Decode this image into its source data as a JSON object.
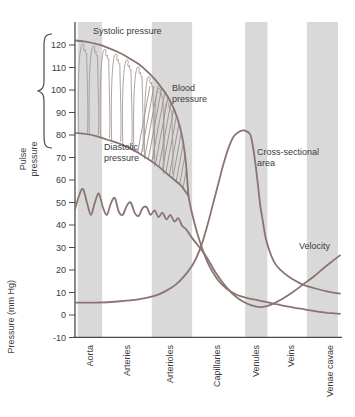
{
  "colors": {
    "curve": "#8a7471",
    "waveform": "#a39a96",
    "hatch": "#8f8782",
    "band": "#d9d9d9",
    "axis": "#4a4a4a",
    "text": "#3b3b3b"
  },
  "annotations": {
    "systolic": "Systolic pressure",
    "diastolic": "Diastolic pressure",
    "blood_pressure": "Blood pressure",
    "cross_sectional_area": "Cross-sectional area",
    "velocity": "Velocity",
    "pulse_pressure": "Pulse pressure"
  },
  "chart_data": {
    "type": "line",
    "title": "",
    "ylabel": "Pressure (mm Hg)",
    "ylim": [
      -10,
      130
    ],
    "yticks": [
      120,
      110,
      100,
      90,
      80,
      70,
      60,
      50,
      40,
      30,
      20,
      10,
      0,
      -10
    ],
    "categories": [
      "Aorta",
      "Arteries",
      "Arterioles",
      "Capillaries",
      "Venules",
      "Veins",
      "Venae cavae"
    ],
    "shaded_categories": [
      "Aorta",
      "Arterioles",
      "Venules",
      "Venae cavae"
    ],
    "grid": false,
    "legend_position": "inline-annotations",
    "annotations": [
      "Systolic pressure",
      "Diastolic pressure",
      "Blood pressure",
      "Cross-sectional area",
      "Velocity",
      "Pulse pressure"
    ],
    "x_axis_note": "x values are percent of distance along the vascular tree from aorta to venae cavae",
    "category_x_pct": [
      5.7,
      19.6,
      35.8,
      53.6,
      68.3,
      81.5,
      96.2
    ],
    "band_x_pct": [
      [
        1,
        10.2
      ],
      [
        29,
        44.2
      ],
      [
        64.2,
        72.6
      ],
      [
        87.5,
        99.2
      ]
    ],
    "series": [
      {
        "name": "Systolic pressure",
        "unit": "mm Hg",
        "points": [
          [
            0,
            122
          ],
          [
            4,
            121.5
          ],
          [
            8,
            120.5
          ],
          [
            12,
            119
          ],
          [
            16,
            117
          ],
          [
            20,
            114.5
          ],
          [
            24,
            111.5
          ],
          [
            27,
            108.5
          ],
          [
            30,
            105
          ],
          [
            33,
            100.5
          ],
          [
            36,
            95
          ],
          [
            38.5,
            88
          ],
          [
            40.5,
            79
          ],
          [
            41.8,
            68
          ],
          [
            42.8,
            53
          ]
        ]
      },
      {
        "name": "Diastolic pressure",
        "unit": "mm Hg",
        "points": [
          [
            0,
            81
          ],
          [
            4,
            80.5
          ],
          [
            8,
            79.5
          ],
          [
            12,
            78
          ],
          [
            16,
            76.5
          ],
          [
            20,
            74.5
          ],
          [
            24,
            72
          ],
          [
            28,
            69
          ],
          [
            31,
            66.5
          ],
          [
            34,
            63.5
          ],
          [
            37,
            60.5
          ],
          [
            40,
            57.5
          ],
          [
            42.8,
            53
          ]
        ]
      },
      {
        "name": "Blood pressure",
        "unit": "mm Hg",
        "points": [
          [
            42.8,
            53
          ],
          [
            44,
            46
          ],
          [
            45.5,
            39
          ],
          [
            47,
            33
          ],
          [
            48.5,
            28
          ],
          [
            50,
            23.5
          ],
          [
            52,
            19
          ],
          [
            54,
            15.5
          ],
          [
            56,
            13
          ],
          [
            58,
            11
          ],
          [
            61,
            9
          ],
          [
            64,
            7.8
          ],
          [
            68,
            6.8
          ],
          [
            72,
            5.8
          ],
          [
            76,
            4.8
          ],
          [
            80,
            3.8
          ],
          [
            85,
            2.8
          ],
          [
            90,
            1.8
          ],
          [
            95,
            1
          ],
          [
            100,
            0.5
          ]
        ]
      },
      {
        "name": "Cross-sectional area",
        "unit": "relative (plotted on pressure scale)",
        "points": [
          [
            0,
            5.5
          ],
          [
            8,
            5.5
          ],
          [
            16,
            6
          ],
          [
            24,
            7
          ],
          [
            30,
            8.5
          ],
          [
            34,
            10.5
          ],
          [
            38,
            13.5
          ],
          [
            41,
            17
          ],
          [
            44,
            21.5
          ],
          [
            46,
            26
          ],
          [
            48,
            32
          ],
          [
            50,
            40
          ],
          [
            52,
            49
          ],
          [
            54,
            58
          ],
          [
            56,
            67
          ],
          [
            58,
            74.5
          ],
          [
            60,
            79.5
          ],
          [
            62,
            81.5
          ],
          [
            64,
            82
          ],
          [
            66,
            80.5
          ],
          [
            67,
            76
          ],
          [
            68,
            68
          ],
          [
            69,
            58
          ],
          [
            70,
            48
          ],
          [
            71,
            41
          ],
          [
            72,
            34
          ],
          [
            74,
            26.5
          ],
          [
            76,
            22
          ],
          [
            79,
            18.5
          ],
          [
            82,
            16
          ],
          [
            86,
            13.5
          ],
          [
            90,
            12
          ],
          [
            95,
            10.5
          ],
          [
            100,
            9.5
          ]
        ]
      },
      {
        "name": "Velocity",
        "unit": "relative (plotted on pressure scale)",
        "points": [
          [
            0,
            47
          ],
          [
            1.5,
            53
          ],
          [
            3,
            56
          ],
          [
            4.5,
            50
          ],
          [
            6,
            44.5
          ],
          [
            7.5,
            50
          ],
          [
            9,
            54
          ],
          [
            10.5,
            48
          ],
          [
            12,
            44.5
          ],
          [
            13.5,
            49.5
          ],
          [
            15,
            52
          ],
          [
            16.5,
            46
          ],
          [
            18,
            44.5
          ],
          [
            19.5,
            48.5
          ],
          [
            21,
            50
          ],
          [
            22.5,
            45.5
          ],
          [
            24,
            44
          ],
          [
            25.5,
            47.5
          ],
          [
            27,
            48
          ],
          [
            28.5,
            44.5
          ],
          [
            30,
            46.5
          ],
          [
            31.5,
            43.5
          ],
          [
            33,
            45.5
          ],
          [
            34.5,
            42.5
          ],
          [
            36,
            44.5
          ],
          [
            37.5,
            41.5
          ],
          [
            39,
            43
          ],
          [
            40.5,
            39.5
          ],
          [
            42,
            38
          ],
          [
            44,
            34.5
          ],
          [
            46,
            31.5
          ],
          [
            48,
            28.5
          ],
          [
            50,
            25
          ],
          [
            53,
            19
          ],
          [
            56,
            14
          ],
          [
            59,
            10
          ],
          [
            62,
            7
          ],
          [
            65,
            5
          ],
          [
            68,
            3.8
          ],
          [
            71,
            3.6
          ],
          [
            74,
            4.6
          ],
          [
            78,
            7
          ],
          [
            82,
            10
          ],
          [
            86,
            13.5
          ],
          [
            90,
            17
          ],
          [
            94,
            21
          ],
          [
            97,
            23.8
          ],
          [
            100,
            26.5
          ]
        ]
      }
    ],
    "pulse_waveform_x_pct": [
      3.2,
      7.3,
      11.5,
      15.7,
      19.9,
      24.1,
      28.2,
      32,
      35.3
    ]
  }
}
